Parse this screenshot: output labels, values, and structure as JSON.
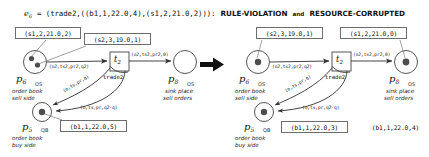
{
  "header": {
    "event_var": "e",
    "event_sub": "6",
    "eq": "= (trade2,((b1,1,22.0,4),(s1,2,21.0,2))):",
    "tag1": "RULE-VIOLATION",
    "conj": "and",
    "tag2": "RESOURCE-CORRUPTED"
  },
  "transition_arrow": "big-right-arrow",
  "left": {
    "boxes": [
      {
        "id": "box-s1-left",
        "text": "(s1,2,21.0,2)"
      },
      {
        "id": "box-s2-left",
        "text": "(s2,3,19.0,1)"
      },
      {
        "id": "box-b1-left",
        "text": "(b1,1,22.0,5)"
      }
    ],
    "places": [
      {
        "id": "p6",
        "name": "p",
        "sub": "6",
        "type": "OS",
        "desc_line1": "order book",
        "desc_line2": "sell side",
        "tokens": 2
      },
      {
        "id": "p8",
        "name": "p",
        "sub": "8",
        "type": "OS",
        "desc_line1": "sink place",
        "desc_line2": "sell orders",
        "tokens": 0
      },
      {
        "id": "p5",
        "name": "p",
        "sub": "5",
        "type": "QB",
        "desc_line1": "order book",
        "desc_line2": "buy side",
        "tokens": 1
      }
    ],
    "transition": {
      "id": "t2",
      "name": "t",
      "sub": "2",
      "label": "trade2"
    },
    "arcs": [
      {
        "id": "arc-p6-t2",
        "label": "(o2,ts2,pr2,q2)"
      },
      {
        "id": "arc-t2-p8",
        "label": "(o2,ts2,pr2,0)"
      },
      {
        "id": "arc-t2-p5",
        "label": "(o,ts,pr,q)"
      },
      {
        "id": "arc-p5-t2",
        "label": "(o,ts,pr,q2-q)"
      }
    ]
  },
  "right": {
    "boxes": [
      {
        "id": "box-s2-right",
        "text": "(s2,3,19.0,1)"
      },
      {
        "id": "box-s1-right",
        "text": "(s1,2,21.0,0)"
      },
      {
        "id": "box-b1-right-in",
        "text": "(b1,1,22.0,3)"
      },
      {
        "id": "box-b1-right-out",
        "text": "(b1,1,22.0,4)"
      }
    ],
    "places": [
      {
        "id": "p6",
        "name": "p",
        "sub": "6",
        "type": "OS",
        "desc_line1": "order book",
        "desc_line2": "sell side",
        "tokens": 1
      },
      {
        "id": "p8",
        "name": "p",
        "sub": "8",
        "type": "OS",
        "desc_line1": "sink place",
        "desc_line2": "sell orders",
        "tokens": 1
      },
      {
        "id": "p5",
        "name": "p",
        "sub": "5",
        "type": "QB",
        "desc_line1": "order book",
        "desc_line2": "buy side",
        "tokens": 1
      }
    ],
    "transition": {
      "id": "t2",
      "name": "t",
      "sub": "2",
      "label": "trade2"
    },
    "arcs": [
      {
        "id": "arc-p6-t2",
        "label": "(o2,ts2,pr2,q2)"
      },
      {
        "id": "arc-t2-p8",
        "label": "(o2,ts2,pr2,0)"
      },
      {
        "id": "arc-t2-p5",
        "label": "(o,ts,pr,q)"
      },
      {
        "id": "arc-p5-t2",
        "label": "(o,ts,pr,q2-q)"
      }
    ]
  },
  "colors": {
    "stroke": "#555555",
    "box_border": "#6d6d6d",
    "token": "#4d4d4d",
    "text": "#111111"
  }
}
